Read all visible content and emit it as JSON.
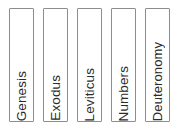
{
  "canvas": {
    "width": 194,
    "height": 130,
    "background_color": "#ffffff"
  },
  "style": {
    "box_border_color": "#8d8d8d",
    "box_fill_color": "#ffffff",
    "text_color": "#2b2b2b",
    "text_orientation": "rotated-90-ccw-bottom-to-top",
    "text_alignment": "bottom"
  },
  "spines": {
    "count": 5,
    "items": [
      {
        "label": "Genesis"
      },
      {
        "label": "Exodus"
      },
      {
        "label": "Leviticus"
      },
      {
        "label": "Numbers"
      },
      {
        "label": "Deuteronomy"
      }
    ]
  }
}
